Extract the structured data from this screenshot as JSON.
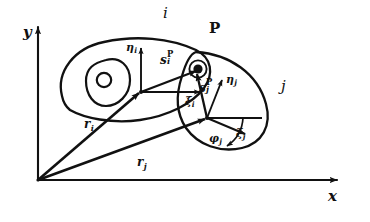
{
  "figure": {
    "kind": "planar-multibody-kinematics-diagram",
    "background_color": "#ffffff",
    "ink_color": "#111111",
    "width": 370,
    "height": 222
  },
  "global_frame": {
    "origin_label": "",
    "x_axis_label": "x",
    "y_axis_label": "y"
  },
  "bodies": [
    {
      "id": "i",
      "label": "i"
    },
    {
      "id": "j",
      "label": "j"
    }
  ],
  "point": {
    "label": "P"
  },
  "body_i_frame": {
    "eta_label": "η",
    "eta_sub": "i",
    "xi_label": "ξ",
    "xi_sub": "i"
  },
  "body_j_frame": {
    "eta_label": "η",
    "eta_sub": "j",
    "xi_label": "ξ",
    "xi_sub": "j",
    "angle_label": "φ",
    "angle_sub": "j"
  },
  "vectors": {
    "s_i": {
      "base": "s",
      "sub": "i",
      "sup": "P"
    },
    "s_j": {
      "base": "s",
      "sub": "j",
      "sup": "P"
    },
    "r_i": {
      "base": "r",
      "sub": "i"
    },
    "r_j": {
      "base": "r",
      "sub": "j"
    }
  }
}
